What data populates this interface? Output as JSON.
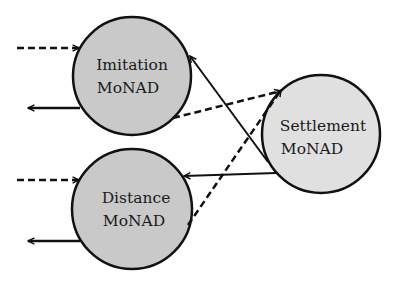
{
  "diagram": {
    "nodes": [
      {
        "id": "imitation",
        "line1": "Imitation",
        "line2": "MoNAD",
        "fill": "#c9c9c9",
        "cx": 132,
        "cy": 76,
        "r": 59
      },
      {
        "id": "distance",
        "line1": "Distance",
        "line2": "MoNAD",
        "fill": "#c9c9c9",
        "cx": 132,
        "cy": 209,
        "r": 60
      },
      {
        "id": "settlement",
        "line1": "Settlement",
        "line2": "MoNAD",
        "fill": "#e0e0e0",
        "cx": 321,
        "cy": 134,
        "r": 59
      }
    ],
    "edges": [
      {
        "from": "external",
        "to": "imitation",
        "style": "dashed",
        "desc": "input"
      },
      {
        "from": "imitation",
        "to": "external",
        "style": "solid",
        "desc": "output"
      },
      {
        "from": "external",
        "to": "distance",
        "style": "dashed",
        "desc": "input"
      },
      {
        "from": "distance",
        "to": "external",
        "style": "solid",
        "desc": "output"
      },
      {
        "from": "imitation",
        "to": "settlement",
        "style": "dashed"
      },
      {
        "from": "distance",
        "to": "settlement",
        "style": "dashed"
      },
      {
        "from": "settlement",
        "to": "imitation",
        "style": "solid"
      },
      {
        "from": "settlement",
        "to": "distance",
        "style": "solid"
      }
    ],
    "stroke_color": "#111111"
  }
}
